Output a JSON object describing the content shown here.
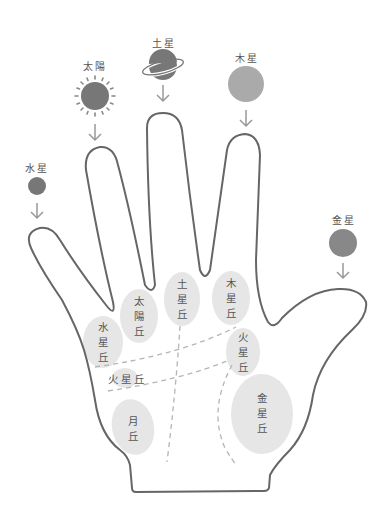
{
  "diagram": {
    "colors": {
      "outline": "#666666",
      "planet_dark": "#777777",
      "planet_light": "#aaaaaa",
      "mount_fill": "#e6e6e6",
      "text": "#555555",
      "dash": "#b5b5b5",
      "arrow": "#999999"
    },
    "planets": {
      "sun": {
        "label": "太陽",
        "icon": "sun-icon"
      },
      "saturn": {
        "label": "土星",
        "icon": "saturn-icon"
      },
      "jupiter": {
        "label": "木星",
        "icon": "jupiter-icon"
      },
      "mercury": {
        "label": "水星",
        "icon": "mercury-icon"
      },
      "venus": {
        "label": "金星",
        "icon": "venus-icon"
      }
    },
    "mounts": {
      "mercury": {
        "chars": [
          "水",
          "星",
          "丘"
        ]
      },
      "sun": {
        "chars": [
          "太",
          "陽",
          "丘"
        ]
      },
      "saturn": {
        "chars": [
          "土",
          "星",
          "丘"
        ]
      },
      "jupiter": {
        "chars": [
          "木",
          "星",
          "丘"
        ]
      },
      "mars_upper": {
        "chars": [
          "火",
          "星",
          "丘"
        ]
      },
      "mars_lower": {
        "label": "火星丘"
      },
      "moon": {
        "chars": [
          "月",
          "丘"
        ]
      },
      "venus": {
        "chars": [
          "金",
          "星",
          "丘"
        ]
      }
    }
  }
}
